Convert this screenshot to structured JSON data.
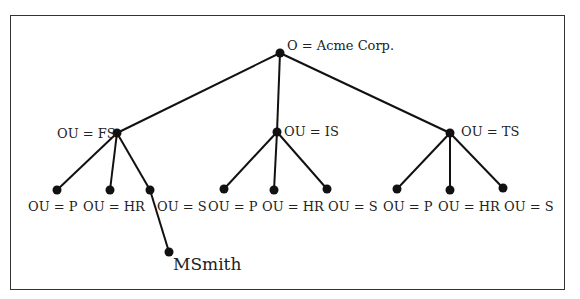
{
  "diagram": {
    "type": "tree",
    "root": {
      "label": "O = Acme Corp."
    },
    "branches": [
      {
        "label": "OU = FS",
        "children": [
          "OU = P",
          "OU = HR",
          "OU = S"
        ],
        "leaf_under_S": "MSmith"
      },
      {
        "label": "OU = IS",
        "children": [
          "OU = P",
          "OU = HR",
          "OU = S"
        ]
      },
      {
        "label": "OU = TS",
        "children": [
          "OU = P",
          "OU = HR",
          "OU = S"
        ]
      }
    ],
    "colors": {
      "line": "#111111",
      "node": "#111111",
      "frame": "#333333",
      "text": "#222222"
    }
  }
}
